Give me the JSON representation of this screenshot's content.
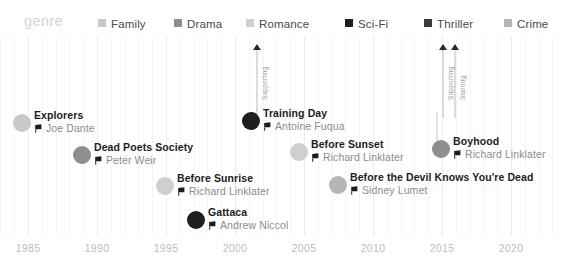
{
  "legend": {
    "title": "genre",
    "items": [
      {
        "label": "Family",
        "color": "#c9c9c9",
        "x": 98
      },
      {
        "label": "Drama",
        "color": "#8f8f8f",
        "x": 174
      },
      {
        "label": "Romance",
        "color": "#cfcfcf",
        "x": 246
      },
      {
        "label": "Sci-Fi",
        "color": "#1f1f1f",
        "x": 345
      },
      {
        "label": "Thriller",
        "color": "#3a3a3a",
        "x": 424
      },
      {
        "label": "Crime",
        "color": "#b5b5b5",
        "x": 504
      }
    ]
  },
  "axis": {
    "ticks": [
      "1985",
      "1990",
      "1995",
      "2000",
      "2005",
      "2010",
      "2015",
      "2020"
    ],
    "tick_x": [
      28,
      97,
      166,
      235,
      304,
      373,
      442,
      511
    ],
    "minor_step": 13.8,
    "range": [
      1983.0,
      2021.5
    ]
  },
  "chart_data": {
    "type": "scatter",
    "title": "genre",
    "xlabel": "",
    "ylabel": "",
    "xlim": [
      1983.0,
      2021.5
    ],
    "grid": true,
    "legend_position": "top",
    "series": [
      {
        "name": "Family",
        "color": "#c9c9c9",
        "points": [
          {
            "title": "Explorers",
            "director": "Joe Dante",
            "year": 1985,
            "x": 22,
            "y": 87,
            "r": 9
          }
        ]
      },
      {
        "name": "Drama",
        "color": "#8f8f8f",
        "points": [
          {
            "title": "Dead Poets Society",
            "director": "Peter Weir",
            "year": 1989,
            "x": 82,
            "y": 119,
            "r": 9
          },
          {
            "title": "Boyhood",
            "director": "Richard Linklater",
            "year": 2014,
            "x": 441,
            "y": 113,
            "r": 9
          }
        ]
      },
      {
        "name": "Romance",
        "color": "#cfcfcf",
        "points": [
          {
            "title": "Before Sunrise",
            "director": "Richard Linklater",
            "year": 1995,
            "x": 165,
            "y": 150,
            "r": 9
          },
          {
            "title": "Before Sunset",
            "director": "Richard Linklater",
            "year": 2004,
            "x": 299,
            "y": 116,
            "r": 9
          }
        ]
      },
      {
        "name": "Sci-Fi",
        "color": "#1f1f1f",
        "points": [
          {
            "title": "Gattaca",
            "director": "Andrew Niccol",
            "year": 1997,
            "x": 196,
            "y": 184,
            "r": 9
          }
        ]
      },
      {
        "name": "Thriller",
        "color": "#3a3a3a",
        "points": [
          {
            "title": "Training Day",
            "director": "Antoine Fuqua",
            "year": 2001,
            "x": 251,
            "y": 85,
            "r": 9
          }
        ]
      },
      {
        "name": "Crime",
        "color": "#b5b5b5",
        "points": [
          {
            "title": "Before the Devil Knows You're Dead",
            "director": "Sidney Lumet",
            "year": 2007,
            "x": 338,
            "y": 149,
            "r": 9
          }
        ]
      }
    ]
  },
  "events": [
    {
      "id": "explorers",
      "title": "Explorers",
      "director": "Joe Dante",
      "color": "#c9c9c9",
      "dot_x": 22,
      "dot_y": 87,
      "r": 9,
      "text_x": 34,
      "text_y": 86
    },
    {
      "id": "dead-poets-society",
      "title": "Dead Poets Society",
      "director": "Peter Weir",
      "color": "#8f8f8f",
      "dot_x": 82,
      "dot_y": 119,
      "r": 9,
      "text_x": 94,
      "text_y": 118
    },
    {
      "id": "before-sunrise",
      "title": "Before Sunrise",
      "director": "Richard Linklater",
      "color": "#cfcfcf",
      "dot_x": 165,
      "dot_y": 150,
      "r": 9,
      "text_x": 177,
      "text_y": 149
    },
    {
      "id": "gattaca",
      "title": "Gattaca",
      "director": "Andrew Niccol",
      "color": "#1f1f1f",
      "dot_x": 196,
      "dot_y": 184,
      "r": 9,
      "text_x": 208,
      "text_y": 183
    },
    {
      "id": "training-day",
      "title": "Training Day",
      "director": "Antoine Fuqua",
      "color": "#1f1f1f",
      "dot_x": 251,
      "dot_y": 85,
      "r": 9,
      "text_x": 263,
      "text_y": 84
    },
    {
      "id": "before-sunset",
      "title": "Before Sunset",
      "director": "Richard Linklater",
      "color": "#cfcfcf",
      "dot_x": 299,
      "dot_y": 116,
      "r": 9,
      "text_x": 311,
      "text_y": 115
    },
    {
      "id": "before-the-devil-knows-youre-dead",
      "title": "Before the Devil Knows You're Dead",
      "director": "Sidney Lumet",
      "color": "#b5b5b5",
      "dot_x": 338,
      "dot_y": 149,
      "r": 9,
      "text_x": 350,
      "text_y": 148
    },
    {
      "id": "boyhood",
      "title": "Boyhood",
      "director": "Richard Linklater",
      "color": "#8f8f8f",
      "dot_x": 441,
      "dot_y": 113,
      "r": 9,
      "text_x": 453,
      "text_y": 112
    }
  ],
  "annotations": [
    {
      "id": "training-day-role",
      "label": "Supporting",
      "x": 251,
      "top": 8,
      "stem_height": 68,
      "connector_top": 76,
      "connector_height": 0
    },
    {
      "id": "boyhood-role-1",
      "label": "Supporting",
      "x": 437,
      "top": 8,
      "stem_height": 68,
      "connector_top": 76,
      "connector_height": 29
    },
    {
      "id": "boyhood-role-2",
      "label": "Starring",
      "x": 449,
      "top": 8,
      "stem_height": 68,
      "connector_top": 76,
      "connector_height": 0
    }
  ]
}
